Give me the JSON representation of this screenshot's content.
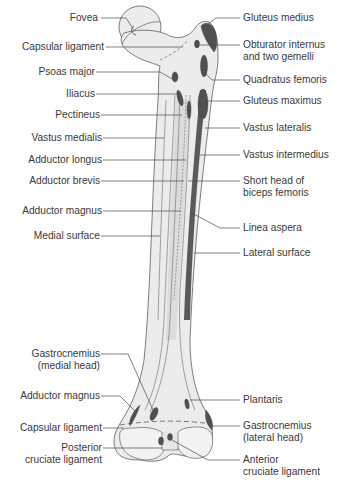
{
  "diagram": {
    "colors": {
      "bone_fill": "#ececec",
      "bone_shade": "#d9d9d9",
      "bone_outline": "#6e6e6e",
      "attachment_dark": "#505050",
      "leader_line": "#4a4a4a",
      "label_text": "#3a3a3a"
    },
    "labels_left": [
      {
        "id": "fovea",
        "text": "Fovea"
      },
      {
        "id": "capsular-ligament-top",
        "text": "Capsular ligament"
      },
      {
        "id": "psoas-major",
        "text": "Psoas major"
      },
      {
        "id": "iliacus",
        "text": "Iliacus"
      },
      {
        "id": "pectineus",
        "text": "Pectineus"
      },
      {
        "id": "vastus-medialis",
        "text": "Vastus medialis"
      },
      {
        "id": "adductor-longus",
        "text": "Adductor longus"
      },
      {
        "id": "adductor-brevis",
        "text": "Adductor brevis"
      },
      {
        "id": "adductor-magnus-top",
        "text": "Adductor magnus"
      },
      {
        "id": "medial-surface",
        "text": "Medial surface"
      },
      {
        "id": "gastrocnemius-medial",
        "line1": "Gastrocnemius",
        "line2": "(medial head)"
      },
      {
        "id": "adductor-magnus-bottom",
        "text": "Adductor magnus"
      },
      {
        "id": "capsular-ligament-bottom",
        "text": "Capsular ligament"
      },
      {
        "id": "posterior-cruciate",
        "line1": "Posterior",
        "line2": "cruciate ligament"
      }
    ],
    "labels_right": [
      {
        "id": "gluteus-medius",
        "text": "Gluteus medius"
      },
      {
        "id": "obturator-internus",
        "line1": "Obturator internus",
        "line2": "and two gemelli"
      },
      {
        "id": "quadratus-femoris",
        "text": "Quadratus femoris"
      },
      {
        "id": "gluteus-maximus",
        "text": "Gluteus maximus"
      },
      {
        "id": "vastus-lateralis",
        "text": "Vastus lateralis"
      },
      {
        "id": "vastus-intermedius",
        "text": "Vastus intermedius"
      },
      {
        "id": "short-head-biceps",
        "line1": "Short head of",
        "line2": "biceps femoris"
      },
      {
        "id": "linea-aspera",
        "text": "Linea aspera"
      },
      {
        "id": "lateral-surface",
        "text": "Lateral surface"
      },
      {
        "id": "plantaris",
        "text": "Plantaris"
      },
      {
        "id": "gastrocnemius-lateral",
        "line1": "Gastrocnemius",
        "line2": "(lateral head)"
      },
      {
        "id": "anterior-cruciate",
        "line1": "Anterior",
        "line2": "cruciate ligament"
      }
    ]
  }
}
